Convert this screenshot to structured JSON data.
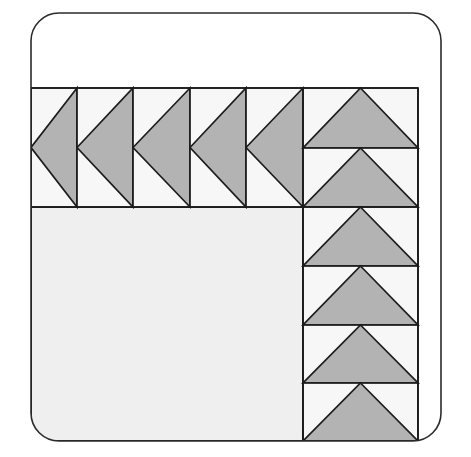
{
  "canvas": {
    "width": 471,
    "height": 457,
    "background": "#ffffff"
  },
  "frame": {
    "name": "rounded-rectangle-border",
    "x": 31,
    "y": 13,
    "width": 410,
    "height": 428,
    "corner_radius": 28,
    "stroke": "#2b2b2b",
    "stroke_width": 1.6,
    "fill": "#ffffff"
  },
  "colors": {
    "triangle_fill": "#b3b3b3",
    "cell_fill": "#f7f7f7",
    "plain_block_fill": "#efefef",
    "outline": "#1c1c1c",
    "page_background": "#ffffff",
    "frame_stroke": "#2b2b2b"
  },
  "layout": {
    "grid_left": 31,
    "grid_right": 418,
    "grid_top": 88,
    "grid_middle": 207,
    "grid_bottom": 441,
    "right_column_left": 303,
    "top_row_dividers": [
      77,
      133,
      190,
      246,
      303
    ],
    "right_column_dividers": [
      266,
      325,
      383
    ],
    "top_right_divider": 148
  },
  "shapes": {
    "top_row_label": "top row of left-pointing triangles",
    "right_column_label": "right column of up-pointing triangles",
    "plain_block_label": "large plain block",
    "top_right_label": "upper-right up-pointing triangles"
  },
  "cells": {
    "top_row": [
      {
        "name": "triangle-left-1",
        "x0": 31,
        "x1": 77,
        "y0": 88,
        "y1": 207,
        "direction": "left",
        "clipped": true
      },
      {
        "name": "triangle-left-2",
        "x0": 77,
        "x1": 133,
        "y0": 88,
        "y1": 207,
        "direction": "left",
        "clipped": false
      },
      {
        "name": "triangle-left-3",
        "x0": 133,
        "x1": 190,
        "y0": 88,
        "y1": 207,
        "direction": "left",
        "clipped": false
      },
      {
        "name": "triangle-left-4",
        "x0": 190,
        "x1": 246,
        "y0": 88,
        "y1": 207,
        "direction": "left",
        "clipped": false
      },
      {
        "name": "triangle-left-5",
        "x0": 246,
        "x1": 303,
        "y0": 88,
        "y1": 207,
        "direction": "left",
        "clipped": false
      }
    ],
    "top_right": [
      {
        "name": "triangle-up-tr-1",
        "x0": 303,
        "x1": 418,
        "y0": 88,
        "y1": 148,
        "direction": "up"
      },
      {
        "name": "triangle-up-tr-2",
        "x0": 303,
        "x1": 418,
        "y0": 148,
        "y1": 207,
        "direction": "up"
      }
    ],
    "right_column": [
      {
        "name": "triangle-up-rc-1",
        "x0": 303,
        "x1": 418,
        "y0": 207,
        "y1": 266,
        "direction": "up"
      },
      {
        "name": "triangle-up-rc-2",
        "x0": 303,
        "x1": 418,
        "y0": 266,
        "y1": 325,
        "direction": "up"
      },
      {
        "name": "triangle-up-rc-3",
        "x0": 303,
        "x1": 418,
        "y0": 325,
        "y1": 383,
        "direction": "up"
      },
      {
        "name": "triangle-up-rc-4",
        "x0": 303,
        "x1": 418,
        "y0": 383,
        "y1": 441,
        "direction": "up",
        "clipped": true
      }
    ],
    "plain_block": {
      "name": "plain-block",
      "x0": 31,
      "x1": 303,
      "y0": 207,
      "y1": 441
    }
  }
}
